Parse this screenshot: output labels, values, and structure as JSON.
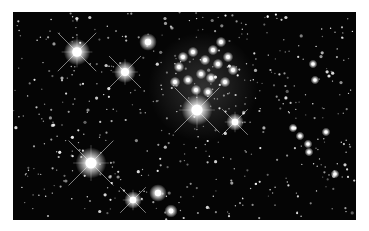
{
  "image": {
    "subject": "Star cluster astronomical photograph (black & white)",
    "background_color": "#050505",
    "frame": {
      "x": 13,
      "y": 12,
      "width": 343,
      "height": 208
    },
    "bright_stars": [
      {
        "x": 64,
        "y": 40,
        "r": 6,
        "spikes": true
      },
      {
        "x": 112,
        "y": 60,
        "r": 5,
        "spikes": true
      },
      {
        "x": 135,
        "y": 30,
        "r": 4,
        "spikes": false
      },
      {
        "x": 184,
        "y": 98,
        "r": 7,
        "spikes": true
      },
      {
        "x": 222,
        "y": 110,
        "r": 4,
        "spikes": true
      },
      {
        "x": 78,
        "y": 151,
        "r": 7,
        "spikes": true
      },
      {
        "x": 120,
        "y": 188,
        "r": 4,
        "spikes": true
      },
      {
        "x": 145,
        "y": 181,
        "r": 4,
        "spikes": false
      },
      {
        "x": 158,
        "y": 199,
        "r": 3,
        "spikes": false
      }
    ],
    "cluster_center": {
      "x": 190,
      "y": 60
    },
    "cluster_stars": [
      {
        "x": 170,
        "y": 45
      },
      {
        "x": 180,
        "y": 40
      },
      {
        "x": 192,
        "y": 48
      },
      {
        "x": 200,
        "y": 38
      },
      {
        "x": 205,
        "y": 52
      },
      {
        "x": 188,
        "y": 62
      },
      {
        "x": 175,
        "y": 68
      },
      {
        "x": 198,
        "y": 66
      },
      {
        "x": 212,
        "y": 70
      },
      {
        "x": 162,
        "y": 70
      },
      {
        "x": 183,
        "y": 78
      },
      {
        "x": 208,
        "y": 30
      },
      {
        "x": 215,
        "y": 45
      },
      {
        "x": 166,
        "y": 55
      },
      {
        "x": 195,
        "y": 80
      },
      {
        "x": 220,
        "y": 58
      }
    ],
    "right_group": [
      {
        "x": 280,
        "y": 116
      },
      {
        "x": 287,
        "y": 124
      },
      {
        "x": 295,
        "y": 132
      },
      {
        "x": 296,
        "y": 140
      },
      {
        "x": 313,
        "y": 120
      },
      {
        "x": 322,
        "y": 162
      },
      {
        "x": 302,
        "y": 68
      },
      {
        "x": 300,
        "y": 52
      }
    ],
    "watermark_text": ""
  }
}
